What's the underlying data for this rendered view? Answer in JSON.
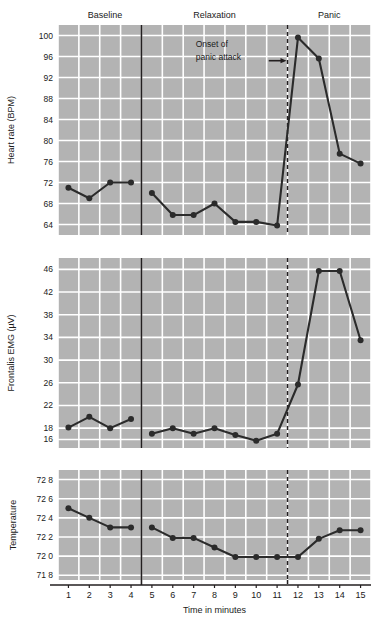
{
  "figure": {
    "background": "#ffffff",
    "plot_fill": "#b3b3b3",
    "grid_color": "#ffffff",
    "line_color": "#2b2b2b",
    "marker_color": "#2b2b2b",
    "axis_color": "#1a1a1a"
  },
  "phases": [
    {
      "name": "baseline-label",
      "label": "Baseline",
      "x_center": 2.75
    },
    {
      "name": "relaxation-label",
      "label": "Relaxation",
      "x_center": 8.0
    },
    {
      "name": "panic-label",
      "label": "Panic",
      "x_center": 13.5
    }
  ],
  "dividers": {
    "solid_x": 4.5,
    "dashed_x": 11.5
  },
  "annotation": {
    "line1": "Onset of",
    "line2": "panic attack",
    "arrow_from_x": 10.6,
    "arrow_to_x": 11.45,
    "arrow_y": 95.2
  },
  "xaxis": {
    "label": "Time in minutes",
    "ticks": [
      1,
      2,
      3,
      4,
      5,
      6,
      7,
      8,
      9,
      10,
      11,
      12,
      13,
      14,
      15
    ],
    "min": 0.5,
    "max": 15.5
  },
  "chart_data": [
    {
      "type": "line",
      "name": "heart-rate",
      "title": "",
      "ylabel": "Heart rate (BPM)",
      "xlabel": "Time in minutes",
      "ylim": [
        62,
        102
      ],
      "yticks": [
        64,
        68,
        72,
        76,
        80,
        84,
        88,
        92,
        96,
        100
      ],
      "ytick_labels": [
        "64",
        "68",
        "72",
        "76",
        "80",
        "84",
        "88",
        "92",
        "96",
        "100"
      ],
      "grid": true,
      "x": [
        1,
        2,
        3,
        4,
        5,
        6,
        7,
        8,
        9,
        10,
        11,
        12,
        13,
        14,
        15
      ],
      "values": [
        71.0,
        69.0,
        72.0,
        72.0,
        70.0,
        65.8,
        65.8,
        68.0,
        64.5,
        64.5,
        63.8,
        99.6,
        95.6,
        77.5,
        75.6
      ],
      "break_after_x": 4
    },
    {
      "type": "line",
      "name": "frontalis-emg",
      "title": "",
      "ylabel": "Frontalis EMG (µV)",
      "xlabel": "Time in minutes",
      "ylim": [
        14.5,
        48
      ],
      "yticks": [
        16,
        18,
        22,
        26,
        30,
        34,
        38,
        42,
        46
      ],
      "ytick_labels": [
        "16",
        "18",
        "22",
        "26",
        "30",
        "34",
        "38",
        "42",
        "46"
      ],
      "grid": true,
      "x": [
        1,
        2,
        3,
        4,
        5,
        6,
        7,
        8,
        9,
        10,
        11,
        12,
        13,
        14,
        15
      ],
      "values": [
        18.1,
        20.0,
        18.0,
        19.6,
        17.0,
        18.0,
        17.0,
        18.0,
        16.8,
        15.8,
        17.0,
        25.7,
        45.7,
        45.7,
        33.5
      ],
      "break_after_x": 4
    },
    {
      "type": "line",
      "name": "temperature",
      "title": "",
      "ylabel": "Temperature",
      "xlabel": "Time in minutes",
      "ylim": [
        71.75,
        72.9
      ],
      "yticks": [
        71.8,
        72.0,
        72.2,
        72.4,
        72.6,
        72.8
      ],
      "ytick_labels": [
        "71 8",
        "72 0",
        "72 2",
        "72 4",
        "72 6",
        "72 8"
      ],
      "grid": true,
      "x": [
        1,
        2,
        3,
        4,
        5,
        6,
        7,
        8,
        9,
        10,
        11,
        12,
        13,
        14,
        15
      ],
      "values": [
        72.5,
        72.4,
        72.3,
        72.3,
        72.3,
        72.19,
        72.19,
        72.09,
        71.99,
        71.99,
        71.99,
        71.99,
        72.18,
        72.27,
        72.27
      ],
      "break_after_x": 4
    }
  ]
}
